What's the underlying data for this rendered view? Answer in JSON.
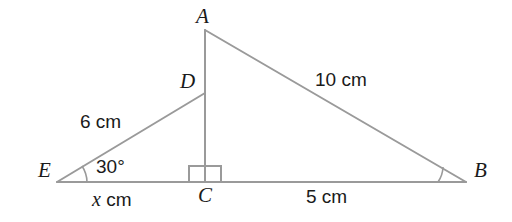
{
  "figure": {
    "type": "geometry-diagram",
    "width": 512,
    "height": 222,
    "background_color": "#ffffff",
    "line_color": "#9a9a9a",
    "label_color": "#1a1a1a",
    "line_width": 2
  },
  "vertices": [
    {
      "name": "A",
      "label": "A",
      "point": {
        "x": 205,
        "y": 30
      },
      "label_pos": {
        "x": 196,
        "y": 6
      }
    },
    {
      "name": "D",
      "label": "D",
      "point": {
        "x": 205,
        "y": 93
      },
      "label_pos": {
        "x": 180,
        "y": 71
      }
    },
    {
      "name": "E",
      "label": "E",
      "point": {
        "x": 57,
        "y": 182
      },
      "label_pos": {
        "x": 38,
        "y": 160
      }
    },
    {
      "name": "C",
      "label": "C",
      "point": {
        "x": 205,
        "y": 182
      },
      "label_pos": {
        "x": 198,
        "y": 185
      }
    },
    {
      "name": "B",
      "label": "B",
      "point": {
        "x": 466,
        "y": 182
      },
      "label_pos": {
        "x": 474,
        "y": 160
      }
    }
  ],
  "segments": [
    {
      "name": "segment-A-B",
      "from": "A",
      "to": "B"
    },
    {
      "name": "segment-A-C",
      "from": "A",
      "to": "C"
    },
    {
      "name": "segment-E-D",
      "from": "E",
      "to": "D"
    },
    {
      "name": "segment-E-B",
      "from": "E",
      "to": "B"
    }
  ],
  "measures": {
    "side_AB": {
      "text": "10 cm",
      "pos": {
        "x": 315,
        "y": 70
      }
    },
    "side_ED": {
      "text": "6 cm",
      "pos": {
        "x": 80,
        "y": 112
      }
    },
    "side_EC": {
      "text": "x cm",
      "var": "x",
      "unit": " cm",
      "pos": {
        "x": 92,
        "y": 189
      }
    },
    "side_CB": {
      "text": "5 cm",
      "pos": {
        "x": 306,
        "y": 187
      }
    }
  },
  "angles": {
    "angle_E": {
      "text": "30°",
      "value": 30,
      "unit": "degrees",
      "pos": {
        "x": 96,
        "y": 157
      },
      "marker": "arc"
    },
    "angle_B": {
      "marker": "arc",
      "text": ""
    },
    "angle_C": {
      "marker": "right-angle-square",
      "value": 90,
      "unit": "degrees",
      "text": ""
    }
  }
}
